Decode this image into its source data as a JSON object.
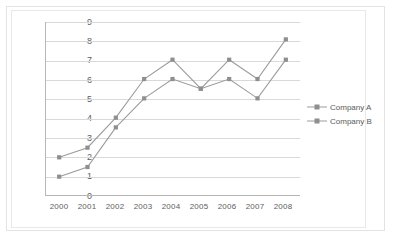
{
  "chart_data": {
    "type": "line",
    "title": "",
    "xlabel": "",
    "ylabel": "",
    "categories": [
      "2000",
      "2001",
      "2002",
      "2003",
      "2004",
      "2005",
      "2006",
      "2007",
      "2008"
    ],
    "series": [
      {
        "name": "Company A",
        "values": [
          1.0,
          1.5,
          3.55,
          5.05,
          6.05,
          5.55,
          6.05,
          5.05,
          7.05
        ],
        "color": "#9b9b9b",
        "marker": "square"
      },
      {
        "name": "Company B",
        "values": [
          2.0,
          2.5,
          4.05,
          6.05,
          7.05,
          5.55,
          7.05,
          6.05,
          8.1
        ],
        "color": "#9b9b9b",
        "marker": "square"
      }
    ],
    "ylim": [
      0,
      9
    ],
    "yticks": [
      "0",
      "1",
      "2",
      "3",
      "4",
      "5",
      "6",
      "7",
      "8",
      "9"
    ],
    "grid": "horizontal",
    "legend_position": "right",
    "axis_color": "#b6b6b6",
    "gridline_color": "#d9d9d9",
    "background_color": "#ffffff"
  },
  "legend": {
    "items": [
      {
        "label": "Company A"
      },
      {
        "label": "Company B"
      }
    ]
  }
}
